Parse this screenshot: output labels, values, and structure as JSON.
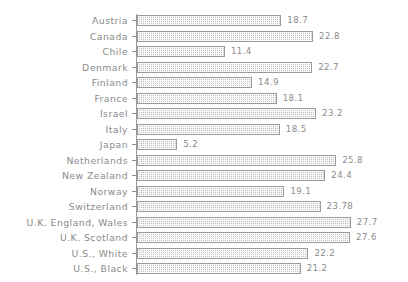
{
  "chart_data": {
    "type": "bar",
    "orientation": "horizontal",
    "title": "",
    "subtitle": "",
    "xlabel": "",
    "ylabel": "",
    "grid": false,
    "legend": null,
    "axis_origin": 0,
    "xlim": [
      0,
      30
    ],
    "value_labels_shown": true,
    "categories": [
      "Austria",
      "Canada",
      "Chile",
      "Denmark",
      "Finland",
      "France",
      "Israel",
      "Italy",
      "Japan",
      "Netherlands",
      "New Zealand",
      "Norway",
      "Switzerland",
      "U.K. England, Wales",
      "U.K. Scotland",
      "U.S., White",
      "U.S., Black"
    ],
    "values": [
      18.7,
      22.8,
      11.4,
      22.7,
      14.9,
      18.1,
      23.2,
      18.5,
      5.2,
      25.8,
      24.4,
      19.1,
      23.78,
      27.7,
      27.6,
      22.2,
      21.2
    ],
    "value_label_text": [
      "18.7",
      "22.8",
      "11.4",
      "22.7",
      "14.9",
      "18.1",
      "23.2",
      "18.5",
      "5.2",
      "25.8",
      "24.4",
      "19.1",
      "23.78",
      "27.7",
      "27.6",
      "22.2",
      "21.2"
    ]
  },
  "style": {
    "background": "#ffffff",
    "bar_fill": "#dcdcdc",
    "bar_border": "#9a9a9a",
    "text_color": "#8b8b8b",
    "axis_color": "#9a9a9a"
  }
}
